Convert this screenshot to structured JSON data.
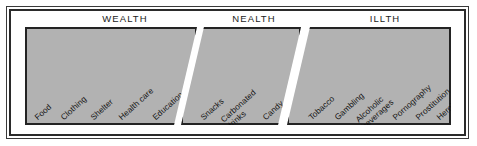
{
  "diagram": {
    "title_row": [
      "WEALTH",
      "NEALTH",
      "ILLTH"
    ],
    "fill_color": "#b2b2b2",
    "outline_color": "#232323",
    "background": "#ffffff",
    "sections": [
      {
        "header": "WEALTH",
        "items": [
          {
            "line1": "Food",
            "line2": ""
          },
          {
            "line1": "Clothing",
            "line2": ""
          },
          {
            "line1": "Shelter",
            "line2": ""
          },
          {
            "line1": "Health care",
            "line2": ""
          },
          {
            "line1": "Education",
            "line2": ""
          }
        ]
      },
      {
        "header": "NEALTH",
        "items": [
          {
            "line1": "Snacks",
            "line2": ""
          },
          {
            "line1": "Carbonated",
            "line2": "drinks"
          },
          {
            "line1": "Candy",
            "line2": ""
          }
        ]
      },
      {
        "header": "ILLTH",
        "items": [
          {
            "line1": "Tobacco",
            "line2": ""
          },
          {
            "line1": "Gambling",
            "line2": ""
          },
          {
            "line1": "Alcoholic",
            "line2": "beverages"
          },
          {
            "line1": "Pornography",
            "line2": ""
          },
          {
            "line1": "Prostitution",
            "line2": ""
          },
          {
            "line1": "Heroin",
            "line2": ""
          }
        ]
      }
    ]
  }
}
